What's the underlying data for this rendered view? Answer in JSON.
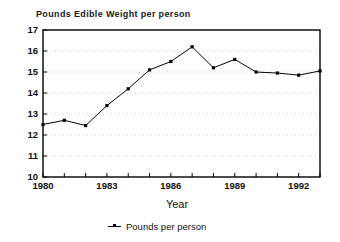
{
  "chart_data": {
    "type": "line",
    "title": "Pounds Edible Weight per person",
    "xlabel": "Year",
    "ylabel": "",
    "xlim": [
      1980,
      1993
    ],
    "ylim": [
      10,
      17
    ],
    "grid": true,
    "legend_position": "bottom",
    "x": [
      1980,
      1981,
      1982,
      1983,
      1984,
      1985,
      1986,
      1987,
      1988,
      1989,
      1990,
      1991,
      1992,
      1993
    ],
    "series": [
      {
        "name": "Pounds per person",
        "values": [
          12.5,
          12.7,
          12.45,
          13.4,
          14.2,
          15.1,
          15.5,
          16.2,
          15.2,
          15.6,
          15.0,
          14.95,
          14.85,
          15.05
        ]
      }
    ],
    "xticks": [
      1980,
      1983,
      1986,
      1989,
      1992
    ],
    "xtick_labels": [
      "1980",
      "1983",
      "1986",
      "1989",
      "1992"
    ],
    "yticks": [
      10,
      11,
      12,
      13,
      14,
      15,
      16,
      17
    ],
    "ytick_labels": [
      "10",
      "11",
      "12",
      "13",
      "14",
      "15",
      "16",
      "17"
    ],
    "line_color": "#000000",
    "marker": "square",
    "marker_color": "#000000",
    "grid_color": "#cccccc",
    "frame_color": "#000000",
    "background": "#ffffff"
  },
  "legend": {
    "entries": [
      {
        "label": "Pounds per person"
      }
    ]
  }
}
